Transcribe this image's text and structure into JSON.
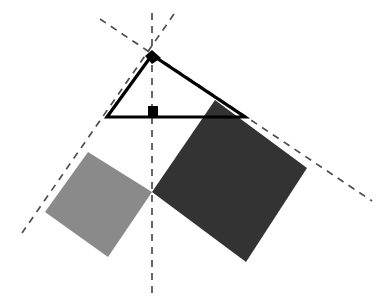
{
  "figure": {
    "background_color": "#ffffff",
    "width": 379,
    "height": 298
  },
  "palette": {
    "stroke_black": "#000000",
    "light_square_fill": "#8a8a8a",
    "dark_square_fill": "#333333",
    "dashed_line_color": "#4d4d4d",
    "artifact_color": "#e6e6e6"
  },
  "triangle": {
    "label": "right triangle",
    "stroke_width": 3.2,
    "fill": "none",
    "vertices": {
      "apex": {
        "x": 152,
        "y": 55
      },
      "left": {
        "x": 107,
        "y": 117
      },
      "right": {
        "x": 245,
        "y": 117
      }
    },
    "points": "152,55 107,117 245,117",
    "right_angle_marker": {
      "label": "right angle at base midpoint",
      "x": 148,
      "y": 106,
      "width": 10,
      "height": 10,
      "fill": "#000000"
    },
    "apex_marker": {
      "label": "apex vertex dot",
      "points": "145,56 152,50 161,58 152,64",
      "fill": "#000000"
    }
  },
  "squares": [
    {
      "name": "light-square",
      "description": "square erected on the left leg",
      "fill": "#8a8a8a",
      "points": "88,152 152,192 108,257 45,212"
    },
    {
      "name": "dark-square",
      "description": "square erected on the right leg",
      "fill": "#333333",
      "points": "215,100 307,168 246,262 152,192"
    }
  ],
  "dashed_lines": [
    {
      "name": "vertical-altitude",
      "description": "vertical dashed axis through apex and shared square vertex",
      "x1": 152,
      "y1": 13,
      "x2": 152,
      "y2": 298,
      "dash": "7 6"
    },
    {
      "name": "diagonal-left-descending",
      "description": "dashed diagonal from upper right through apex to lower left square corner",
      "x1": 174,
      "y1": 14,
      "x2": 22,
      "y2": 233,
      "dash": "7 6"
    },
    {
      "name": "diagonal-right-descending",
      "description": "dashed diagonal from upper left through apex to lower right beyond dark square",
      "x1": 100,
      "y1": 19,
      "x2": 372,
      "y2": 201,
      "dash": "7 6"
    }
  ],
  "artifacts": [
    {
      "name": "page-scan-edge",
      "description": "faint gray arc at left margin from page scan"
    }
  ]
}
